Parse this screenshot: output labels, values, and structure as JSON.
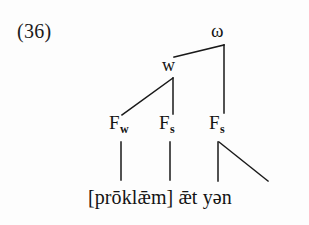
{
  "figure": {
    "example_number": "(36)",
    "type": "prosodic-tree-diagram",
    "ink_color": "#141414",
    "background_color": "#fdfdfd"
  },
  "tree": {
    "nodes": {
      "omega": {
        "label": "ω",
        "name": "prosodic-word-node"
      },
      "w": {
        "label": "w",
        "name": "weak-node"
      },
      "foot_weak": {
        "label": "F",
        "subscript": "w",
        "name": "foot-weak-node"
      },
      "foot_strong_1": {
        "label": "F",
        "subscript": "s",
        "name": "foot-strong-node-1"
      },
      "foot_strong_2": {
        "label": "F",
        "subscript": "s",
        "name": "foot-strong-node-2"
      }
    },
    "edges": [
      {
        "from": "omega",
        "to": "w",
        "style": "diagonal-left"
      },
      {
        "from": "omega",
        "to": "foot_strong_2",
        "style": "vertical"
      },
      {
        "from": "w",
        "to": "foot_weak",
        "style": "diagonal-left"
      },
      {
        "from": "w",
        "to": "foot_strong_1",
        "style": "vertical"
      },
      {
        "from": "foot_weak",
        "to": "terminal_1",
        "style": "vertical"
      },
      {
        "from": "foot_strong_1",
        "to": "terminal_2",
        "style": "vertical"
      },
      {
        "from": "foot_strong_2",
        "to": "terminal_3",
        "style": "vertical"
      },
      {
        "from": "foot_strong_2",
        "to": "terminal_4",
        "style": "diagonal-right"
      }
    ]
  },
  "transcription": {
    "full_line": "[prōklǣm] ǣt yən",
    "segments": [
      {
        "text": "[prōklǣm]",
        "name": "terminal-proklaem"
      },
      {
        "text": "ǣt",
        "name": "terminal-aet"
      },
      {
        "text": "yən",
        "name": "terminal-yen"
      }
    ]
  }
}
